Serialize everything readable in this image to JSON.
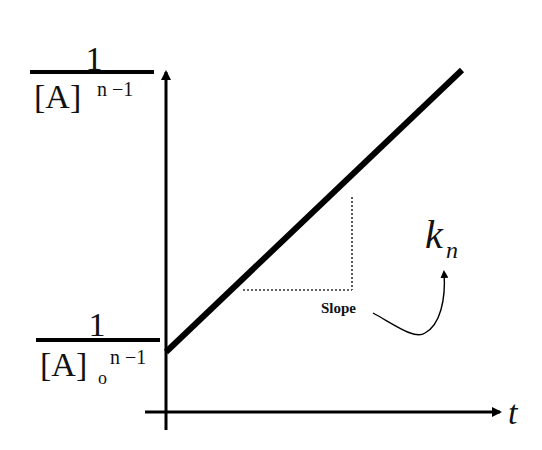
{
  "diagram": {
    "y_axis_label": {
      "numerator": "1",
      "denominator_base": "[A]",
      "denominator_exp": "n −1"
    },
    "y_intercept_label": {
      "numerator": "1",
      "denominator_base": "[A]",
      "denominator_sub": "o",
      "denominator_exp": "n −1"
    },
    "x_axis_label": "t",
    "slope_label": "Slope",
    "rate_constant": {
      "symbol": "k",
      "subscript": "n"
    },
    "colors": {
      "line": "#000000",
      "background": "#ffffff"
    }
  }
}
